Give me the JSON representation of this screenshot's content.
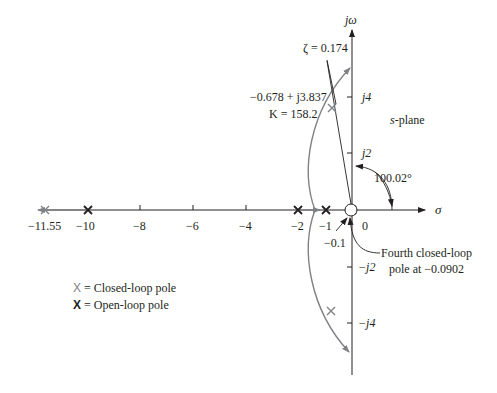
{
  "axes": {
    "real_axis_label": "σ",
    "imag_axis_label": "jω",
    "plane_label": "s-plane",
    "real_ticks": [
      "−11.55",
      "−10",
      "−8",
      "−6",
      "−4",
      "−2",
      "−1",
      "0"
    ],
    "imag_ticks": [
      "j4",
      "j2",
      "−j2",
      "−j4"
    ]
  },
  "annotations": {
    "zeta": "ζ = 0.174",
    "dominant_pole_value": "−0.678 + j3.837",
    "gain": "K = 158.2",
    "angle": "100.02°",
    "near_origin_pole": "−0.1",
    "fourth_pole_line1": "Fourth closed-loop",
    "fourth_pole_line2": "pole at −0.0902"
  },
  "legend": {
    "closed_loop_marker": "X",
    "closed_loop_label": "= Closed-loop pole",
    "open_loop_marker": "X",
    "open_loop_label": "= Open-loop pole"
  },
  "colors": {
    "axis": "#231f20",
    "locus": "#808285",
    "closed_loop_pole": "#808285",
    "open_loop_pole": "#231f20"
  },
  "poles": {
    "open_loop": [
      -10,
      -2,
      -1,
      0
    ],
    "closed_loop": [
      "−11.55",
      "−0.678 + j3.837",
      "−0.678 − j3.837",
      "−0.0902"
    ]
  }
}
